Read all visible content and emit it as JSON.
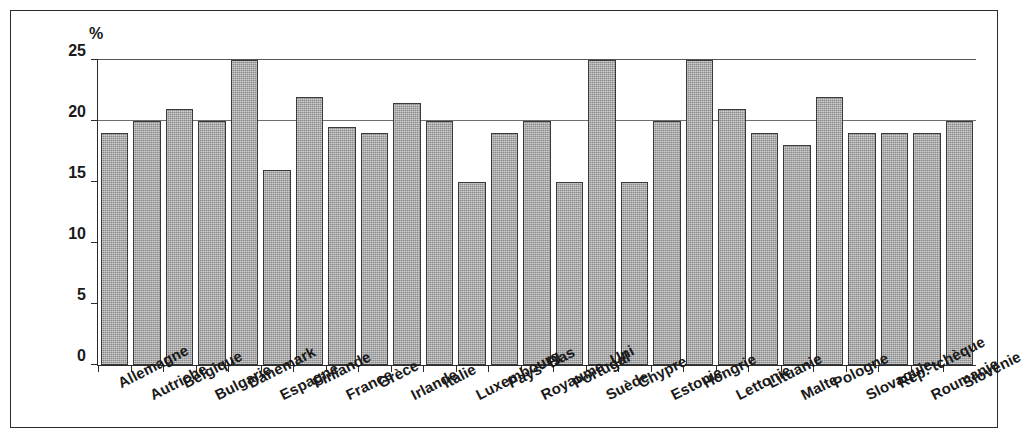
{
  "figure": {
    "unit_label": "%"
  },
  "chart_data": {
    "type": "bar",
    "title": "",
    "xlabel": "",
    "ylabel": "%",
    "ylim": [
      0,
      25
    ],
    "yticks": [
      0,
      5,
      10,
      15,
      20,
      25
    ],
    "ytick_labels": [
      "0",
      "5",
      "10",
      "15",
      "20",
      "25"
    ],
    "gridlines": [
      20,
      25
    ],
    "grid": true,
    "legend": "none",
    "bar_color": "#9b9b9b",
    "bar_edge_color": "#3a3a3a",
    "categories": [
      "Allemagne",
      "Autriche",
      "Belgique",
      "Bulgarie",
      "Danemark",
      "Espagne",
      "Finlande",
      "France",
      "Grèce",
      "Irlande",
      "Italie",
      "Luxembourg",
      "Pays- Bas",
      "Royaume- Uni",
      "Portugal",
      "Suède",
      "Chypre",
      "Estonie",
      "Hongrie",
      "Lettonie",
      "Lituanie",
      "Malte",
      "Pologne",
      "Slovaquie",
      "Rép. tchèque",
      "Roumanie",
      "Slovénie"
    ],
    "values": [
      19,
      20,
      21,
      20,
      25,
      16,
      22,
      19.5,
      19,
      21.5,
      20,
      15,
      19,
      20,
      15,
      25,
      15,
      20,
      25,
      21,
      19,
      18,
      22,
      19,
      19,
      19,
      20
    ]
  }
}
